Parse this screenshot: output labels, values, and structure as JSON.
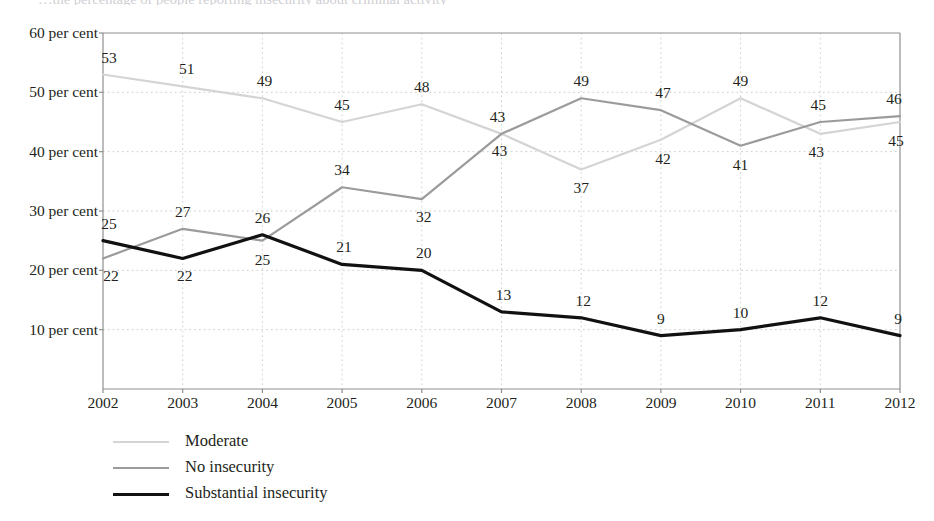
{
  "figure": {
    "title_fragment": "…the percentage of people reporting insecurity about criminal activity",
    "y_axis_unit_suffix": "per cent"
  },
  "chart_data": {
    "type": "line",
    "title": "",
    "xlabel": "",
    "ylabel": "",
    "categories": [
      "2002",
      "2003",
      "2004",
      "2005",
      "2006",
      "2007",
      "2008",
      "2009",
      "2010",
      "2011",
      "2012"
    ],
    "x": [
      2002,
      2003,
      2004,
      2005,
      2006,
      2007,
      2008,
      2009,
      2010,
      2011,
      2012
    ],
    "ylim": [
      0,
      60
    ],
    "yticks": [
      10,
      20,
      30,
      40,
      50,
      60
    ],
    "ytick_labels": [
      "10 per cent",
      "20 per cent",
      "30 per cent",
      "40 per cent",
      "50 per cent",
      "60 per cent"
    ],
    "grid": true,
    "grid_style": "dotted-horizontal-and-vertical",
    "legend_position": "below-left",
    "series": [
      {
        "name": "Moderate",
        "color": "#d4d4d4",
        "width": 2.2,
        "values": [
          53,
          51,
          49,
          45,
          48,
          43,
          37,
          42,
          49,
          43,
          45
        ],
        "label_offsets": [
          {
            "dx": 6,
            "dy": -17
          },
          {
            "dx": 4,
            "dy": -17
          },
          {
            "dx": 2,
            "dy": -17
          },
          {
            "dx": 0,
            "dy": -17
          },
          {
            "dx": 0,
            "dy": -17
          },
          {
            "dx": -2,
            "dy": 17
          },
          {
            "dx": 0,
            "dy": 19
          },
          {
            "dx": 2,
            "dy": 19
          },
          {
            "dx": 0,
            "dy": -17
          },
          {
            "dx": -4,
            "dy": 18
          },
          {
            "dx": -4,
            "dy": 19
          }
        ]
      },
      {
        "name": "No insecurity",
        "color": "#9b9b9b",
        "width": 2.2,
        "values": [
          22,
          27,
          25,
          34,
          32,
          43,
          49,
          47,
          41,
          45,
          46
        ],
        "label_offsets": [
          {
            "dx": 8,
            "dy": 18
          },
          {
            "dx": 0,
            "dy": -17
          },
          {
            "dx": 0,
            "dy": 19
          },
          {
            "dx": 0,
            "dy": -17
          },
          {
            "dx": 2,
            "dy": 18
          },
          {
            "dx": -4,
            "dy": -17
          },
          {
            "dx": 0,
            "dy": -17
          },
          {
            "dx": 2,
            "dy": -17
          },
          {
            "dx": 0,
            "dy": 19
          },
          {
            "dx": -2,
            "dy": -17
          },
          {
            "dx": -6,
            "dy": -17
          }
        ]
      },
      {
        "name": "Substantial insecurity",
        "color": "#111111",
        "width": 3.2,
        "values": [
          25,
          22,
          26,
          21,
          20,
          13,
          12,
          9,
          10,
          12,
          9
        ],
        "label_offsets": [
          {
            "dx": 6,
            "dy": -17
          },
          {
            "dx": 2,
            "dy": 18
          },
          {
            "dx": 0,
            "dy": -17
          },
          {
            "dx": 2,
            "dy": -17
          },
          {
            "dx": 2,
            "dy": -17
          },
          {
            "dx": 2,
            "dy": -17
          },
          {
            "dx": 2,
            "dy": -17
          },
          {
            "dx": 0,
            "dy": -17
          },
          {
            "dx": 0,
            "dy": -17
          },
          {
            "dx": 0,
            "dy": -17
          },
          {
            "dx": -2,
            "dy": -17
          }
        ]
      }
    ]
  },
  "legend": {
    "items": [
      {
        "label": "Moderate",
        "color": "#d4d4d4",
        "width": 2.4
      },
      {
        "label": "No insecurity",
        "color": "#9b9b9b",
        "width": 2.4
      },
      {
        "label": "Substantial insecurity",
        "color": "#111111",
        "width": 3.4
      }
    ]
  },
  "geometry": {
    "plot_left": 103,
    "plot_right": 900,
    "plot_top": 33,
    "plot_bottom": 389,
    "y_min": 0,
    "y_max": 60
  }
}
